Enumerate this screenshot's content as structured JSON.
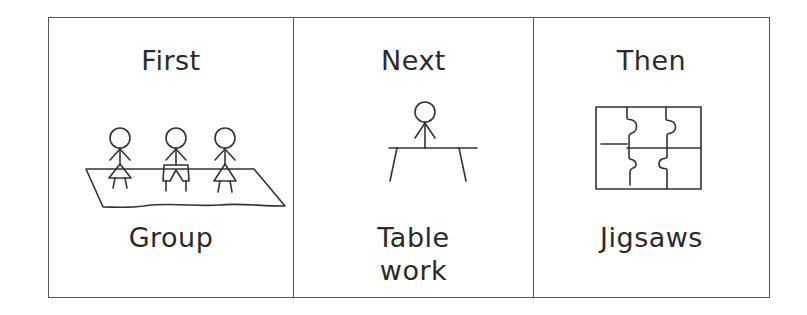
{
  "schedule": {
    "panels": [
      {
        "heading": "First",
        "caption_lines": [
          "Group"
        ],
        "pictogram": "group-mat-icon"
      },
      {
        "heading": "Next",
        "caption_lines": [
          "Table",
          "work"
        ],
        "pictogram": "table-work-icon"
      },
      {
        "heading": "Then",
        "caption_lines": [
          "Jigsaws"
        ],
        "pictogram": "jigsaw-icon"
      }
    ]
  },
  "colors": {
    "line": "#333333",
    "border": "#555555",
    "text": "#2a2a2a",
    "background": "#ffffff"
  }
}
